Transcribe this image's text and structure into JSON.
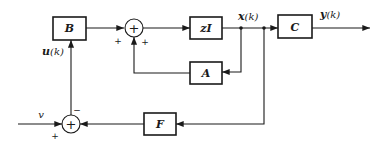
{
  "diagram": {
    "type": "state-feedback block diagram (discrete-time)",
    "blocks": {
      "B": {
        "label": "B"
      },
      "zI": {
        "label": "zI"
      },
      "C": {
        "label": "C"
      },
      "A": {
        "label": "A"
      },
      "F": {
        "label": "F"
      }
    },
    "summing_junctions": {
      "sum_state": {
        "symbol": "+",
        "signs": [
          "+",
          "+"
        ]
      },
      "sum_input": {
        "symbol": "+",
        "signs": [
          "+",
          "−"
        ]
      }
    },
    "signals": {
      "input": "v",
      "control": "u(k)",
      "state": "x(k)",
      "output": "y(k)"
    },
    "connections": [
      {
        "from": "v",
        "to": "sum_input",
        "sign": "+"
      },
      {
        "from": "F",
        "to": "sum_input",
        "sign": "−"
      },
      {
        "from": "sum_input",
        "to": "B",
        "signal": "u(k)"
      },
      {
        "from": "B",
        "to": "sum_state",
        "sign": "+"
      },
      {
        "from": "A",
        "to": "sum_state",
        "sign": "+"
      },
      {
        "from": "sum_state",
        "to": "zI"
      },
      {
        "from": "zI",
        "to": "C",
        "signal": "x(k)"
      },
      {
        "from": "x(k)",
        "to": "A"
      },
      {
        "from": "x(k)",
        "to": "F"
      },
      {
        "from": "C",
        "to": "output",
        "signal": "y(k)"
      }
    ]
  },
  "labels": {
    "B": "B",
    "zI": "zI",
    "C": "C",
    "A": "A",
    "F": "F",
    "u": "u",
    "u_arg": "(k)",
    "x": "x",
    "x_arg": "(k)",
    "y": "y",
    "y_arg": "(k)",
    "v": "v",
    "sum_symbol": "+",
    "plus": "+",
    "minus": "−"
  }
}
